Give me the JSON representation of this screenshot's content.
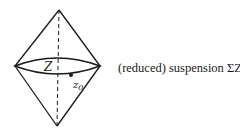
{
  "diagram": {
    "labels": {
      "space": "Z",
      "basepoint": "z",
      "basepoint_sub": "0"
    },
    "caption": "(reduced) suspension ΣZ",
    "colors": {
      "stroke": "#1a1a1a",
      "background": "#ffffff"
    }
  }
}
